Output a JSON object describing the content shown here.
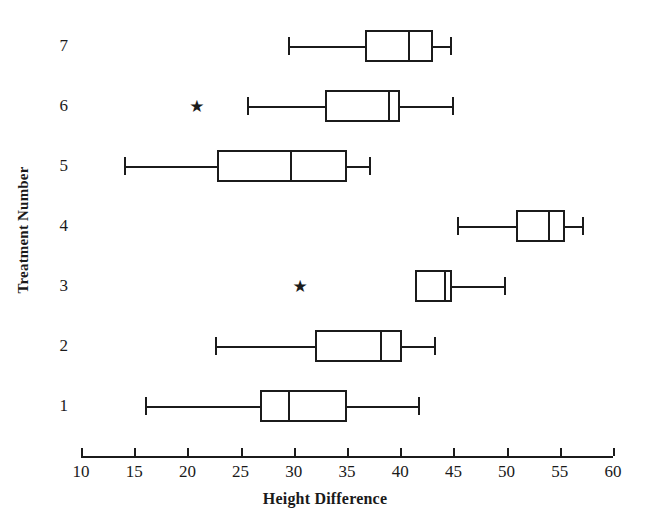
{
  "chart_data": {
    "type": "box",
    "title": "",
    "xlabel": "Height Difference",
    "ylabel": "Treatment Number",
    "xlim": [
      10,
      60
    ],
    "xticks": [
      10,
      15,
      20,
      25,
      30,
      35,
      40,
      45,
      50,
      55,
      60
    ],
    "xtick_labels": [
      "10",
      "15",
      "20",
      "25",
      "30",
      "35",
      "40",
      "45",
      "50",
      "55",
      "60"
    ],
    "grid": false,
    "legend": false,
    "orientation": "horizontal",
    "categories": [
      "1",
      "2",
      "3",
      "4",
      "5",
      "6",
      "7"
    ],
    "boxes": [
      {
        "category": "7",
        "label": "7",
        "min": 29.5,
        "q1": 36.7,
        "median": 40.7,
        "q3": 43.1,
        "max": 44.9,
        "outliers": []
      },
      {
        "category": "6",
        "label": "6",
        "min": 25.6,
        "q1": 32.9,
        "median": 38.9,
        "q3": 40.0,
        "max": 45.1,
        "outliers": [
          20.9
        ]
      },
      {
        "category": "5",
        "label": "5",
        "min": 14.0,
        "q1": 22.8,
        "median": 29.6,
        "q3": 35.0,
        "max": 37.3,
        "outliers": []
      },
      {
        "category": "4",
        "label": "4",
        "min": 45.3,
        "q1": 50.9,
        "median": 53.9,
        "q3": 55.5,
        "max": 57.3,
        "outliers": []
      },
      {
        "category": "3",
        "label": "3",
        "min": 41.4,
        "q1": 41.4,
        "median": 44.1,
        "q3": 44.9,
        "max": 49.9,
        "outliers": [
          30.6
        ]
      },
      {
        "category": "2",
        "label": "2",
        "min": 22.6,
        "q1": 32.0,
        "median": 38.1,
        "q3": 40.2,
        "max": 43.4,
        "outliers": []
      },
      {
        "category": "1",
        "label": "1",
        "min": 16.0,
        "q1": 26.8,
        "median": 29.5,
        "q3": 35.0,
        "max": 41.9,
        "outliers": []
      }
    ]
  },
  "style": {
    "stroke_color": "#1b1b1b",
    "background_color": "#ffffff",
    "outlier_glyph": "★"
  }
}
